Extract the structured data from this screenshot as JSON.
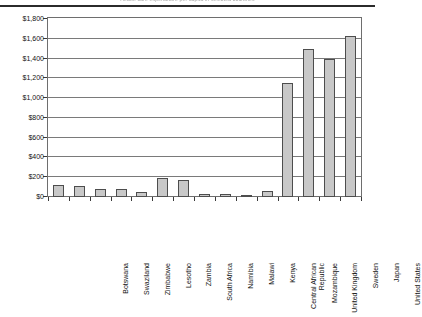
{
  "chart_data": {
    "type": "bar",
    "title": "Health care expenditure per capita in selected countries",
    "xlabel": "",
    "ylabel": "",
    "ylim": [
      0,
      1800
    ],
    "ytick_step": 200,
    "ytick_labels": [
      "$1,800",
      "$1,600",
      "$1,400",
      "$1,200",
      "$1,000",
      "$800",
      "$600",
      "$400",
      "$200",
      "$0"
    ],
    "ytick_values": [
      1800,
      1600,
      1400,
      1200,
      1000,
      800,
      600,
      400,
      200,
      0
    ],
    "grid": true,
    "legend": "none",
    "bar_color": "#c8c8c8",
    "bar_border_color": "#4d4d4d",
    "categories": [
      "Botswana",
      "Swaziland",
      "Zimbabwe",
      "Lesotho",
      "Zambia",
      "South Africa",
      "Namibia",
      "Malawi",
      "Kenya",
      "Central African\nRepublic",
      "Mozambique",
      "United Kingdom",
      "Sweden",
      "Japan",
      "United States"
    ],
    "values": [
      125,
      110,
      85,
      85,
      50,
      190,
      175,
      35,
      30,
      20,
      60,
      1150,
      1500,
      1400,
      1630
    ]
  }
}
